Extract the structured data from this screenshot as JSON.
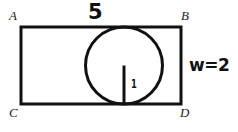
{
  "figure": {
    "kind": "geometry-diagram",
    "stroke_color": "#111111",
    "background_color": "#ffffff",
    "vertices": {
      "A": "A",
      "B": "B",
      "C": "C",
      "D": "D"
    },
    "measures": {
      "top_length": "5",
      "width": "w=2",
      "radius": "1"
    },
    "rectangle": {
      "x": 21,
      "y": 27,
      "width": 160,
      "height": 77,
      "stroke_width": 3
    },
    "circle": {
      "cx": 124,
      "cy": 65.5,
      "r": 38.5,
      "stroke_width": 3
    },
    "radius_segment": {
      "x1": 124,
      "y1": 65.5,
      "x2": 124,
      "y2": 104,
      "stroke_width": 3
    }
  }
}
